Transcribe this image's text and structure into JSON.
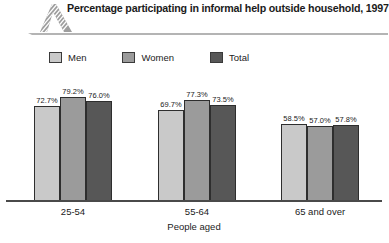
{
  "header": {
    "title": "Percentage participating in informal help outside household, 1997",
    "logo_icon": "striped-chevron-logo-icon",
    "rule_icon": "header-rule-icon"
  },
  "legend": {
    "position": "top-left",
    "entries": [
      {
        "label": "Men",
        "color": "#c9c9c9"
      },
      {
        "label": "Women",
        "color": "#9b9b9b"
      },
      {
        "label": "Total",
        "color": "#575757"
      }
    ]
  },
  "chart_data": {
    "type": "bar",
    "title": "Percentage participating in informal help outside household, 1997",
    "xlabel": "People aged",
    "ylabel": "",
    "categories": [
      "25-54",
      "55-64",
      "65 and over"
    ],
    "ylim": [
      0,
      100
    ],
    "grid": false,
    "legend_position": "top-left",
    "series": [
      {
        "name": "Men",
        "color": "#c9c9c9",
        "values": [
          72.7,
          69.7,
          58.5
        ],
        "labels": [
          "72.7%",
          "69.7%",
          "58.5%"
        ]
      },
      {
        "name": "Women",
        "color": "#9b9b9b",
        "values": [
          79.2,
          77.3,
          57.0
        ],
        "labels": [
          "79.2%",
          "77.3%",
          "57.0%"
        ]
      },
      {
        "name": "Total",
        "color": "#575757",
        "values": [
          76.0,
          73.5,
          57.8
        ],
        "labels": [
          "76.0%",
          "73.5%",
          "57.8%"
        ]
      }
    ]
  },
  "axis": {
    "x_title": "People aged",
    "tick_labels": [
      "25-54",
      "55-64",
      "65 and over"
    ]
  }
}
